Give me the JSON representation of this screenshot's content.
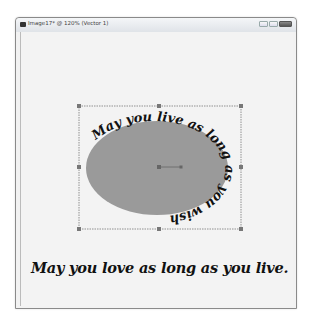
{
  "window": {
    "title": "Image17* @ 120% (Vector 1)",
    "controls": [
      "minimize",
      "maximize",
      "close"
    ]
  },
  "canvas": {
    "shape": {
      "type": "ellipse",
      "fill": "#9a9a9a"
    },
    "path_text": "May you live as long as you wish",
    "bottom_text": "May you love as long as you live."
  }
}
